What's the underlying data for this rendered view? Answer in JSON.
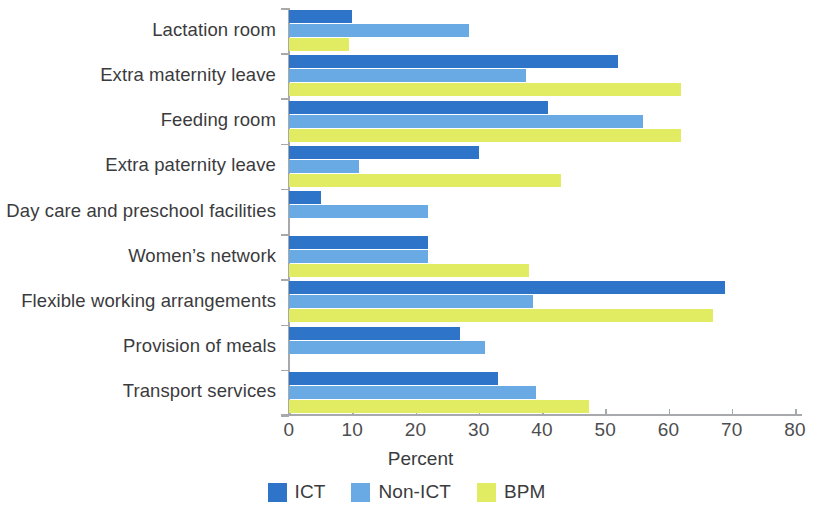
{
  "chart_data": {
    "type": "bar",
    "orientation": "horizontal",
    "title": "",
    "xlabel": "Percent",
    "ylabel": "",
    "xlim": [
      0,
      80
    ],
    "xticks": [
      0,
      10,
      20,
      30,
      40,
      50,
      60,
      70,
      80
    ],
    "grid": false,
    "legend_position": "bottom-center",
    "categories": [
      "Lactation room",
      "Extra maternity leave",
      "Feeding room",
      "Extra paternity leave",
      "Day care and preschool facilities",
      "Women’s network",
      "Flexible working arrangements",
      "Provision of meals",
      "Transport services"
    ],
    "series": [
      {
        "name": "ICT",
        "color": "#2e75c9",
        "values": [
          10,
          52,
          41,
          30,
          5,
          22,
          69,
          27,
          33
        ]
      },
      {
        "name": "Non-ICT",
        "color": "#6aaae4",
        "values": [
          28.5,
          37.5,
          56,
          11,
          22,
          22,
          38.5,
          31,
          39
        ]
      },
      {
        "name": "BPM",
        "color": "#e2ec62",
        "values": [
          9.5,
          62,
          62,
          43,
          0,
          38,
          67,
          0,
          47.5
        ]
      }
    ]
  },
  "axis": {
    "x_title": "Percent",
    "tick_labels": [
      "0",
      "10",
      "20",
      "30",
      "40",
      "50",
      "60",
      "70",
      "80"
    ]
  },
  "legend": {
    "items": [
      {
        "label": "ICT",
        "color": "#2e75c9"
      },
      {
        "label": "Non-ICT",
        "color": "#6aaae4"
      },
      {
        "label": "BPM",
        "color": "#e2ec62"
      }
    ]
  }
}
